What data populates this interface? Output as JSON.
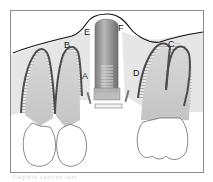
{
  "figure": {
    "type": "dental-implant-diagram",
    "labels": [
      {
        "id": "A",
        "text": "A",
        "x": 82,
        "y": 79
      },
      {
        "id": "B",
        "text": "B",
        "x": 64,
        "y": 48
      },
      {
        "id": "C",
        "text": "C",
        "x": 168,
        "y": 47
      },
      {
        "id": "D",
        "text": "D",
        "x": 133,
        "y": 76
      },
      {
        "id": "E",
        "text": "E",
        "x": 84,
        "y": 35
      },
      {
        "id": "F",
        "text": "F",
        "x": 118,
        "y": 31
      }
    ],
    "elements": [
      "left-incisor-roots",
      "central-implant",
      "right-molar-roots",
      "bone-crest-line",
      "crowns"
    ],
    "colors": {
      "border": "#888888",
      "bone": "#e4e4e4",
      "root": "#c8c8c8",
      "root_outline": "#555555",
      "ligament_hatch": "#7a7a7a",
      "implant": "#9a9a9a",
      "gum_line": "#111111"
    }
  },
  "caption": {
    "text": "illegible caption text"
  }
}
